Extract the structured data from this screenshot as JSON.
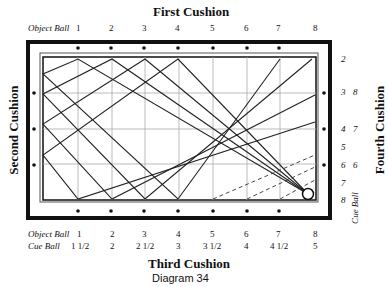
{
  "diagram": {
    "caption": "Diagram 34",
    "cushions": {
      "first": "First Cushion",
      "second": "Second Cushion",
      "third": "Third Cushion",
      "fourth": "Fourth Cushion"
    },
    "top_axis": {
      "label": "Object Ball",
      "values": [
        "1",
        "2",
        "3",
        "4",
        "5",
        "6",
        "7",
        "8"
      ]
    },
    "bottom_axis": {
      "object_ball_label": "Object Ball",
      "object_ball_values": [
        "1",
        "2",
        "3",
        "4",
        "5",
        "6",
        "7",
        "8"
      ],
      "cue_ball_label": "Cue Ball",
      "cue_ball_values": [
        "1 1/2",
        "2",
        "2 1/2",
        "3",
        "3 1/2",
        "4",
        "4 1/2",
        "5"
      ]
    },
    "right_axis": {
      "object_ball_values": [
        "2",
        "3",
        "4",
        "5",
        "6",
        "7",
        "8"
      ],
      "cue_ball_label": "Cue Ball",
      "cue_ball_values": [
        "8",
        "7",
        "6"
      ]
    },
    "colors": {
      "line": "#222222",
      "grid": "#999999",
      "frame": "#111111"
    }
  }
}
